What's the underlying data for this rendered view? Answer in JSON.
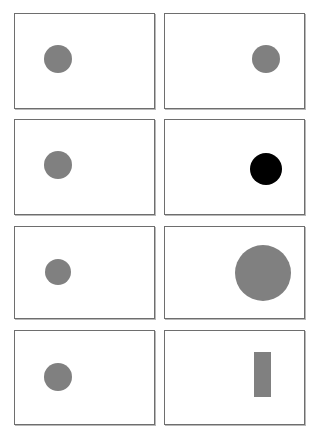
{
  "canvas": {
    "width": 318,
    "height": 439,
    "background": "#ffffff"
  },
  "style": {
    "panel_border_color": "#6e6e6e",
    "panel_background": "#ffffff",
    "panel_shadow_color": "#b8b8b8",
    "gray_fill": "#808080",
    "black_fill": "#000000"
  },
  "grid": {
    "columns": 2,
    "rows": 4,
    "panel_count": 8
  },
  "panels": [
    {
      "id": "panel-r1c1",
      "row": 1,
      "column": 1,
      "left": 14,
      "top": 13,
      "width": 141,
      "height": 96,
      "shape": {
        "name": "gray-circle",
        "type": "circle",
        "fill": "#808080",
        "center_x": 57,
        "center_y": 58,
        "radius": 14
      }
    },
    {
      "id": "panel-r1c2",
      "row": 1,
      "column": 2,
      "left": 164,
      "top": 13,
      "width": 141,
      "height": 96,
      "shape": {
        "name": "gray-circle",
        "type": "circle",
        "fill": "#808080",
        "center_x": 265,
        "center_y": 58,
        "radius": 14
      }
    },
    {
      "id": "panel-r2c1",
      "row": 2,
      "column": 1,
      "left": 14,
      "top": 119,
      "width": 141,
      "height": 96,
      "shape": {
        "name": "gray-circle",
        "type": "circle",
        "fill": "#808080",
        "center_x": 57,
        "center_y": 164,
        "radius": 14
      }
    },
    {
      "id": "panel-r2c2",
      "row": 2,
      "column": 2,
      "left": 164,
      "top": 119,
      "width": 141,
      "height": 96,
      "shape": {
        "name": "black-circle",
        "type": "circle",
        "fill": "#000000",
        "center_x": 265,
        "center_y": 168,
        "radius": 16
      }
    },
    {
      "id": "panel-r3c1",
      "row": 3,
      "column": 1,
      "left": 14,
      "top": 226,
      "width": 141,
      "height": 93,
      "shape": {
        "name": "gray-circle",
        "type": "circle",
        "fill": "#808080",
        "center_x": 57,
        "center_y": 271,
        "radius": 13
      }
    },
    {
      "id": "panel-r3c2",
      "row": 3,
      "column": 2,
      "left": 164,
      "top": 226,
      "width": 141,
      "height": 93,
      "shape": {
        "name": "large-gray-circle",
        "type": "circle",
        "fill": "#808080",
        "center_x": 262,
        "center_y": 272,
        "radius": 28
      }
    },
    {
      "id": "panel-r4c1",
      "row": 4,
      "column": 1,
      "left": 14,
      "top": 330,
      "width": 141,
      "height": 95,
      "shape": {
        "name": "gray-circle",
        "type": "circle",
        "fill": "#808080",
        "center_x": 57,
        "center_y": 376,
        "radius": 14
      }
    },
    {
      "id": "panel-r4c2",
      "row": 4,
      "column": 2,
      "left": 164,
      "top": 330,
      "width": 141,
      "height": 95,
      "shape": {
        "name": "gray-vertical-rectangle",
        "type": "rect",
        "fill": "#808080",
        "left": 253,
        "top": 351,
        "width": 17,
        "height": 45
      }
    }
  ]
}
